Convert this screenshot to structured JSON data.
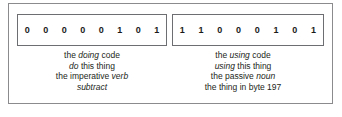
{
  "figure": {
    "colors": {
      "background": "#ffffff",
      "outer_frame_border": "#8b8b8d",
      "byte_box_border": "#6d6e71",
      "text": "#231f20",
      "bit_text": "#1a1a1a"
    },
    "left": {
      "byte_label": "doing code byte",
      "bits": [
        "0",
        "0",
        "0",
        "0",
        "0",
        "1",
        "0",
        "1"
      ],
      "caption": [
        {
          "parts": [
            {
              "text": "the ",
              "italic": false
            },
            {
              "text": "doing",
              "italic": true
            },
            {
              "text": " code",
              "italic": false
            }
          ]
        },
        {
          "parts": [
            {
              "text": "do",
              "italic": true
            },
            {
              "text": " this thing",
              "italic": false
            }
          ]
        },
        {
          "parts": [
            {
              "text": "the imperative ",
              "italic": false
            },
            {
              "text": "verb",
              "italic": true
            }
          ]
        },
        {
          "parts": [
            {
              "text": "subtract",
              "italic": true
            }
          ]
        }
      ]
    },
    "right": {
      "byte_label": "using code byte",
      "bits": [
        "1",
        "1",
        "0",
        "0",
        "0",
        "1",
        "0",
        "1"
      ],
      "caption": [
        {
          "parts": [
            {
              "text": "the ",
              "italic": false
            },
            {
              "text": "using",
              "italic": true
            },
            {
              "text": " code",
              "italic": false
            }
          ]
        },
        {
          "parts": [
            {
              "text": "using",
              "italic": true
            },
            {
              "text": " this thing",
              "italic": false
            }
          ]
        },
        {
          "parts": [
            {
              "text": "the passive ",
              "italic": false
            },
            {
              "text": "noun",
              "italic": true
            }
          ]
        },
        {
          "parts": [
            {
              "text": "the thing in byte 197",
              "italic": false
            }
          ]
        }
      ]
    }
  }
}
